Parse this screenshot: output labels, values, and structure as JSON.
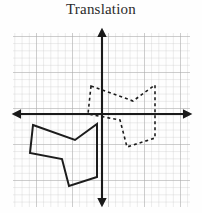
{
  "figure": {
    "title": "Translation",
    "type": "geometry-transformation-diagram"
  },
  "chart_data": {
    "type": "scatter",
    "title": "Translation",
    "xlabel": "",
    "ylabel": "",
    "grid": true,
    "legend": "none",
    "axis": {
      "origin_px": [
        102,
        114
      ],
      "cell_px": 7.2,
      "x_axis_from_px": [
        13,
        114
      ],
      "x_axis_to_px": [
        191,
        114
      ],
      "y_axis_from_px": [
        102,
        29
      ],
      "y_axis_to_px": [
        102,
        206
      ],
      "arrows": [
        "left",
        "right",
        "up",
        "down"
      ],
      "xlim": [
        -12.4,
        12.4
      ],
      "ylim": [
        -12.8,
        11.8
      ],
      "tick_labels": []
    },
    "grid_rect_px": {
      "x": 13,
      "y": 33,
      "width": 177,
      "height": 174
    },
    "series": [
      {
        "name": "pre-image",
        "style": "solid",
        "color": "#1c1c1c",
        "closed": true,
        "stroke_px": 2.0,
        "vertices_px": [
          [
            33,
            125
          ],
          [
            75,
            140
          ],
          [
            97,
            124
          ],
          [
            97,
            177
          ],
          [
            69,
            186
          ],
          [
            62,
            159
          ],
          [
            30,
            153
          ]
        ],
        "vertices_grid": [
          [
            -9.6,
            -1.5
          ],
          [
            -3.8,
            -3.6
          ],
          [
            -0.7,
            -1.4
          ],
          [
            -0.7,
            -8.8
          ],
          [
            -4.6,
            -10.0
          ],
          [
            -5.6,
            -6.3
          ],
          [
            -10.0,
            -5.4
          ]
        ]
      },
      {
        "name": "image",
        "style": "dashed",
        "color": "#1c1c1c",
        "closed": true,
        "stroke_px": 1.6,
        "dash_px": [
          3,
          3
        ],
        "vertices_px": [
          [
            91,
            86
          ],
          [
            133,
            101
          ],
          [
            155,
            85
          ],
          [
            155,
            138
          ],
          [
            127,
            147
          ],
          [
            120,
            120
          ],
          [
            88,
            114
          ]
        ],
        "vertices_grid": [
          [
            -1.5,
            3.9
          ],
          [
            4.3,
            1.8
          ],
          [
            7.4,
            4.0
          ],
          [
            7.4,
            -3.3
          ],
          [
            3.5,
            -4.6
          ],
          [
            2.5,
            -0.8
          ],
          [
            -1.9,
            0.0
          ]
        ]
      }
    ],
    "translation_vector_grid": [
      8.1,
      5.4
    ],
    "translation_vector_px": [
      58,
      -39
    ]
  }
}
